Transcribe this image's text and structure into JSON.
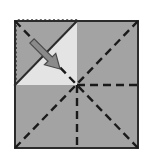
{
  "figure": {
    "title": "Paper folding diagram",
    "canvas": {
      "width": 144,
      "height": 159,
      "background": "#ffffff"
    }
  },
  "colors": {
    "paper_fill": "#a3a3a3",
    "flap_fill": "#e4e4e4",
    "outline_stroke": "#2b2b2b",
    "crease_stroke": "#1a1a1a",
    "ghost_stroke": "#3a3a3a",
    "arrow_fill": "#8a8a8a",
    "arrow_stroke": "#4a4a4a",
    "background": "#ffffff"
  },
  "geometry": {
    "sheet": {
      "label": "folded-sheet",
      "left": 15,
      "top": 21,
      "right": 138,
      "bottom": 148,
      "center_x": 77,
      "center_y": 85
    },
    "ghost_square": {
      "label": "unfolded-flap-outline",
      "left": 16,
      "top": 20,
      "right": 77,
      "bottom": 85,
      "style": "dotted"
    },
    "flap_triangle": {
      "label": "folded-flap",
      "points": "15,85 77,21 77,85",
      "style": "light-fill"
    },
    "creases": [
      {
        "name": "diagonal-tl-br",
        "x1": 15,
        "y1": 21,
        "x2": 138,
        "y2": 148
      },
      {
        "name": "diagonal-bl-tr",
        "x1": 15,
        "y1": 148,
        "x2": 138,
        "y2": 21
      },
      {
        "name": "vertical-center-down",
        "x1": 77,
        "y1": 85,
        "x2": 77,
        "y2": 148
      },
      {
        "name": "horizontal-center-right",
        "x1": 77,
        "y1": 85,
        "x2": 138,
        "y2": 85
      }
    ],
    "fold_arrow": {
      "name": "fold-direction-arrow",
      "tail_x": 32,
      "tail_y": 41,
      "tip_x": 60,
      "tip_y": 69,
      "shaft_width": 6,
      "head_width": 16,
      "head_length": 14
    }
  },
  "labels": {
    "sheet": "Folded square sheet",
    "flap": "Folded corner flap",
    "ghost": "Unfolded flap position",
    "arrow": "Fold direction",
    "creases": "Crease lines"
  }
}
